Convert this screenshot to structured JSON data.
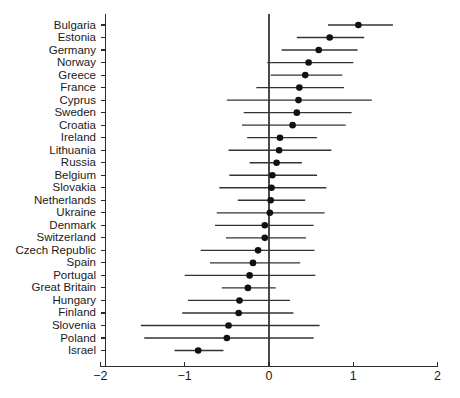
{
  "chart_data": {
    "type": "scatter",
    "subtype": "forest-plot",
    "title": "",
    "subtitle": "",
    "xlabel": "",
    "ylabel": "",
    "xlim": [
      -2.2,
      2.2
    ],
    "xticks": [
      -2,
      -1,
      0,
      1,
      2
    ],
    "xtick_labels": [
      "−2",
      "−1",
      "0",
      "1",
      "2"
    ],
    "grid": false,
    "legend": null,
    "reference_line": 0,
    "marker": "filled-circle",
    "error_bar_style": "horizontal-line",
    "categories": [
      "Bulgaria",
      "Estonia",
      "Germany",
      "Norway",
      "Greece",
      "France",
      "Cyprus",
      "Sweden",
      "Croatia",
      "Ireland",
      "Lithuania",
      "Russia",
      "Belgium",
      "Slovakia",
      "Netherlands",
      "Ukraine",
      "Denmark",
      "Switzerland",
      "Czech Republic",
      "Spain",
      "Portugal",
      "Great Britain",
      "Hungary",
      "Finland",
      "Slovenia",
      "Poland",
      "Israel"
    ],
    "values": [
      1.06,
      0.72,
      0.59,
      0.47,
      0.43,
      0.36,
      0.35,
      0.33,
      0.28,
      0.13,
      0.12,
      0.09,
      0.04,
      0.03,
      0.02,
      0.01,
      -0.05,
      -0.05,
      -0.13,
      -0.19,
      -0.23,
      -0.25,
      -0.35,
      -0.36,
      -0.48,
      -0.5,
      -0.84
    ],
    "ci_low": [
      0.7,
      0.33,
      0.15,
      -0.02,
      0.02,
      -0.15,
      -0.5,
      -0.3,
      -0.32,
      -0.26,
      -0.48,
      -0.23,
      -0.47,
      -0.59,
      -0.37,
      -0.62,
      -0.64,
      -0.51,
      -0.81,
      -0.7,
      -1.0,
      -0.56,
      -0.96,
      -1.03,
      -1.52,
      -1.48,
      -1.12
    ],
    "ci_high": [
      1.47,
      1.13,
      1.05,
      1.0,
      0.87,
      0.89,
      1.22,
      0.98,
      0.91,
      0.57,
      0.74,
      0.39,
      0.57,
      0.68,
      0.43,
      0.66,
      0.53,
      0.44,
      0.54,
      0.37,
      0.55,
      0.08,
      0.25,
      0.29,
      0.6,
      0.53,
      -0.54
    ]
  },
  "colors": {
    "point": "#111111",
    "ci": "#333333",
    "axis": "#2b2b2b",
    "reference": "#4a4a4a",
    "background": "#ffffff",
    "text": "#1a1a1a"
  }
}
